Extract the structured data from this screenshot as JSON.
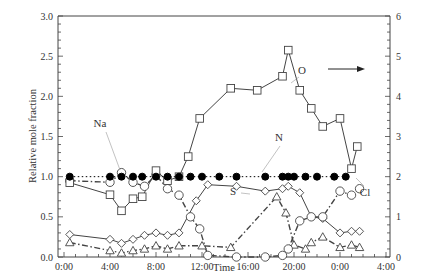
{
  "chart_data": {
    "type": "line",
    "title": "",
    "xlabel": "Time",
    "ylabel": "Relative mole fraction",
    "y2label": "",
    "x_ticks": [
      "0:00",
      "4:00",
      "8:00",
      "12:00",
      "16:00",
      "20:00",
      "0:00",
      "4:00"
    ],
    "y_ticks": [
      "0.0",
      "0.5",
      "1.0",
      "1.5",
      "2.0",
      "2.5",
      "3.0"
    ],
    "y2_ticks": [
      "0",
      "1",
      "2",
      "3",
      "4",
      "5",
      "6"
    ],
    "ylim": [
      0,
      3
    ],
    "y2lim": [
      0,
      6
    ],
    "xlim_hours": [
      0,
      28
    ],
    "grid": false,
    "legend": "none (inline annotations)",
    "annotations": [
      {
        "text": "Na",
        "pointer_to": "Na series near 5:00"
      },
      {
        "text": "O",
        "pointer_to": "O series near 21:00",
        "note": "arrow pointing right → plotted on right axis"
      },
      {
        "text": "N",
        "pointer_to": "N series near 19:00"
      },
      {
        "text": "S",
        "pointer_to": "S series near 16:30"
      },
      {
        "text": "Cl",
        "pointer_to": "Cl series near 25:30"
      }
    ],
    "series": [
      {
        "name": "Na",
        "marker": "filled circle",
        "line": "dotted",
        "axis": "left",
        "x_hours": [
          0.5,
          4.0,
          5.0,
          6.0,
          6.8,
          8.0,
          9.0,
          10.0,
          11.0,
          12.0,
          13.5,
          15.0,
          17.5,
          19.0,
          19.5,
          20.0,
          21.0,
          22.0,
          23.5,
          24.5
        ],
        "values": [
          1.0,
          1.0,
          1.0,
          1.0,
          1.0,
          1.0,
          1.0,
          1.0,
          1.0,
          1.0,
          1.0,
          1.0,
          1.0,
          1.0,
          1.0,
          1.0,
          1.0,
          1.0,
          1.0,
          1.0
        ]
      },
      {
        "name": "O",
        "marker": "open square",
        "line": "solid",
        "axis": "right",
        "x_hours": [
          0.5,
          4.0,
          5.0,
          6.0,
          6.8,
          8.0,
          9.0,
          10.0,
          10.8,
          11.8,
          14.5,
          16.8,
          19.0,
          19.5,
          20.5,
          21.5,
          22.5,
          24.0,
          25.0,
          25.5
        ],
        "values": [
          1.85,
          1.55,
          1.15,
          1.45,
          1.5,
          2.15,
          1.9,
          2.0,
          2.5,
          3.45,
          4.2,
          4.15,
          4.5,
          5.15,
          4.15,
          3.7,
          3.25,
          3.45,
          2.2,
          2.75,
          2.0
        ]
      },
      {
        "name": "N",
        "marker": "open diamond",
        "line": "solid",
        "axis": "left",
        "x_hours": [
          0.5,
          4.0,
          5.0,
          6.0,
          7.0,
          8.0,
          9.0,
          10.0,
          11.5,
          12.5,
          15.0,
          17.5,
          19.0,
          19.5,
          20.5,
          21.5,
          22.5,
          24.0,
          25.0,
          25.7
        ],
        "values": [
          0.28,
          0.22,
          0.17,
          0.22,
          0.27,
          0.3,
          0.27,
          0.3,
          0.7,
          0.9,
          0.88,
          0.82,
          0.85,
          0.88,
          0.8,
          0.5,
          0.48,
          0.3,
          0.32,
          0.32
        ]
      },
      {
        "name": "S",
        "marker": "open triangle",
        "line": "dash-dot",
        "axis": "left",
        "x_hours": [
          0.5,
          4.0,
          5.0,
          6.0,
          7.0,
          8.0,
          9.0,
          10.0,
          12.0,
          14.5,
          18.5,
          19.3,
          20.0,
          21.0,
          21.5,
          22.5,
          24.0,
          25.0,
          25.7
        ],
        "values": [
          0.18,
          0.08,
          0.05,
          0.08,
          0.1,
          0.14,
          0.1,
          0.14,
          0.14,
          0.12,
          0.75,
          0.55,
          0.15,
          0.1,
          0.18,
          0.25,
          0.12,
          0.15,
          0.12
        ]
      },
      {
        "name": "Cl",
        "marker": "open circle",
        "line": "dash-dot",
        "axis": "left",
        "x_hours": [
          0.5,
          4.0,
          5.0,
          6.0,
          7.0,
          8.0,
          9.0,
          10.0,
          11.0,
          11.8,
          12.5,
          15.0,
          17.5,
          19.0,
          19.5,
          20.5,
          21.5,
          22.5,
          24.0,
          25.0,
          25.7
        ],
        "values": [
          0.95,
          0.93,
          1.05,
          0.93,
          0.88,
          1.02,
          0.85,
          0.77,
          0.5,
          0.35,
          0.02,
          0.0,
          0.0,
          0.02,
          0.1,
          0.45,
          0.5,
          0.5,
          0.82,
          0.77,
          0.85
        ]
      }
    ]
  }
}
